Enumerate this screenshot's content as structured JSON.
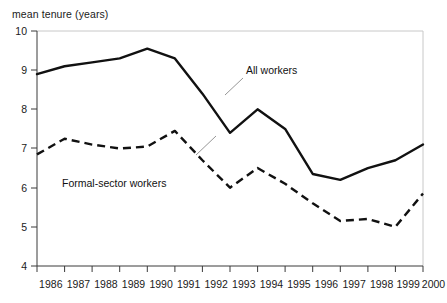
{
  "chart_data": {
    "type": "line",
    "title": "",
    "ylabel": "mean tenure (years)",
    "xlabel": "",
    "ylim": [
      4,
      10
    ],
    "yticks": [
      4,
      5,
      6,
      7,
      8,
      9,
      10
    ],
    "ytick_labels": [
      "4",
      "5",
      "6",
      "7",
      "8",
      "9",
      "10"
    ],
    "grid": false,
    "legend_position": "inline-annotations",
    "categories": [
      1986,
      1987,
      1988,
      1989,
      1990,
      1991,
      1992,
      1993,
      1994,
      1995,
      1996,
      1997,
      1998,
      1999,
      2000
    ],
    "xtick_labels": [
      "1986",
      "1987",
      "1988",
      "1989",
      "1990",
      "1991",
      "1992",
      "1993",
      "1994",
      "1995",
      "1996",
      "1997",
      "1998",
      "1999",
      "2000"
    ],
    "series": [
      {
        "name": "All workers",
        "style": "solid",
        "color": "#111111",
        "values": [
          8.9,
          9.1,
          9.2,
          9.3,
          9.55,
          9.3,
          8.4,
          7.4,
          8.0,
          7.5,
          6.35,
          6.2,
          6.5,
          6.7,
          7.1
        ]
      },
      {
        "name": "Formal-sector workers",
        "style": "dashed",
        "color": "#111111",
        "values": [
          6.85,
          7.25,
          7.1,
          7.0,
          7.05,
          7.45,
          6.7,
          6.0,
          6.5,
          6.1,
          5.6,
          5.15,
          5.2,
          5.0,
          5.85
        ]
      }
    ],
    "annotations": [
      {
        "text": "All workers",
        "series": "All workers"
      },
      {
        "text": "Formal-sector workers",
        "series": "Formal-sector workers"
      }
    ]
  },
  "axes": {
    "y_axis_label": "mean tenure (years)"
  }
}
